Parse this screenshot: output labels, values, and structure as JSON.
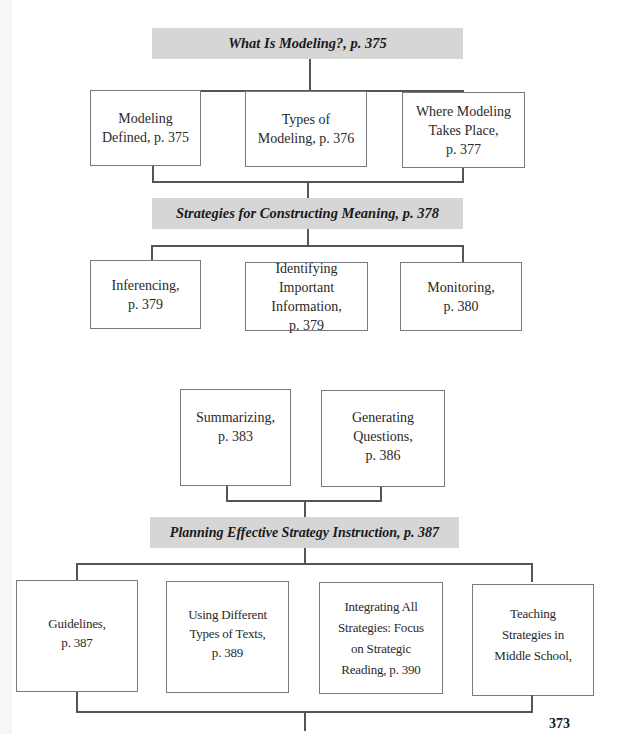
{
  "sections": [
    {
      "title": "What Is Modeling?, p. 375",
      "children": [
        {
          "label": "Modeling\nDefined, p. 375"
        },
        {
          "label": "Types of\nModeling, p. 376"
        },
        {
          "label": "Where Modeling\nTakes Place,\np. 377"
        }
      ]
    },
    {
      "title": "Strategies for Constructing Meaning, p. 378",
      "children": [
        {
          "label": "Inferencing,\np. 379"
        },
        {
          "label": "Identifying\nImportant\nInformation,\np. 379"
        },
        {
          "label": "Monitoring,\np. 380"
        },
        {
          "label": "Summarizing,\np. 383"
        },
        {
          "label": "Generating\nQuestions,\np. 386"
        }
      ]
    },
    {
      "title": "Planning Effective Strategy Instruction, p. 387",
      "children": [
        {
          "label": "Guidelines,\np. 387"
        },
        {
          "label": "Using Different\nTypes of Texts,\np. 389"
        },
        {
          "label": "Integrating All\nStrategies: Focus\non Strategic\nReading, p. 390"
        },
        {
          "label": "Teaching\nStrategies in\nMiddle School,"
        }
      ]
    }
  ],
  "page_number": "373",
  "colors": {
    "header_fill": "#d6d6d6",
    "box_border": "#7a7a7a",
    "connector": "#555555"
  }
}
